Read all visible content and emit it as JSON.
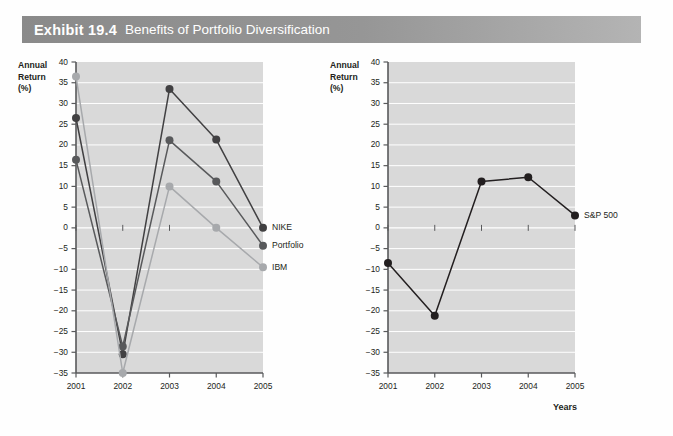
{
  "exhibit": {
    "number": "Exhibit 19.4",
    "title": "Benefits of Portfolio Diversification"
  },
  "axis_caption": "Years",
  "y_axis_title_line1": "Annual",
  "y_axis_title_line2": "Return",
  "y_axis_title_line3": "(%)",
  "colors": {
    "plot_background": "#d9d9d9",
    "gridline": "#ffffff",
    "axis": "#58595b",
    "nike": "#414042",
    "portfolio": "#58595b",
    "ibm": "#a7a9ac",
    "sp500": "#231f20",
    "header_bar": "#8f8f8f",
    "header_text": "#ffffff"
  },
  "chart_data": [
    {
      "id": "left",
      "type": "line",
      "title": "",
      "xlabel": "",
      "ylabel": "Annual Return (%)",
      "x": [
        "2001",
        "2002",
        "2003",
        "2004",
        "2005"
      ],
      "categories": [
        "2001",
        "2002",
        "2003",
        "2004",
        "2005"
      ],
      "ylim": [
        -35,
        40
      ],
      "ytick_values": [
        40,
        35,
        30,
        25,
        20,
        15,
        10,
        5,
        0,
        -5,
        -10,
        -15,
        -20,
        -25,
        -30,
        -35
      ],
      "ytick_labels": [
        "40",
        "35",
        "30",
        "25",
        "20",
        "15",
        "10",
        "5",
        "0",
        "−5",
        "−10",
        "−15",
        "−20",
        "−25",
        "−30",
        "−35"
      ],
      "grid": true,
      "legend_position": "right-of-last-point",
      "series": [
        {
          "name": "NIKE",
          "color": "#414042",
          "values": [
            26.5,
            -30.5,
            33.5,
            21.3,
            0.0
          ]
        },
        {
          "name": "Portfolio",
          "color": "#58595b",
          "values": [
            16.4,
            -28.6,
            21.1,
            11.2,
            -4.3
          ]
        },
        {
          "name": "IBM",
          "color": "#a7a9ac",
          "values": [
            36.5,
            -35.0,
            10.0,
            0.0,
            -9.5
          ]
        }
      ]
    },
    {
      "id": "right",
      "type": "line",
      "title": "",
      "xlabel": "Years",
      "ylabel": "Annual Return (%)",
      "x": [
        "2001",
        "2002",
        "2003",
        "2004",
        "2005"
      ],
      "categories": [
        "2001",
        "2002",
        "2003",
        "2004",
        "2005"
      ],
      "ylim": [
        -35,
        40
      ],
      "ytick_values": [
        40,
        35,
        30,
        25,
        20,
        15,
        10,
        5,
        0,
        -5,
        -10,
        -15,
        -20,
        -25,
        -30,
        -35
      ],
      "ytick_labels": [
        "40",
        "35",
        "30",
        "25",
        "20",
        "15",
        "10",
        "5",
        "0",
        "−5",
        "−10",
        "−15",
        "−20",
        "−25",
        "−30",
        "−35"
      ],
      "grid": true,
      "legend_position": "right-of-last-point",
      "series": [
        {
          "name": "S&P 500",
          "color": "#231f20",
          "values": [
            -8.5,
            -21.2,
            11.2,
            12.2,
            3.0
          ]
        }
      ]
    }
  ]
}
